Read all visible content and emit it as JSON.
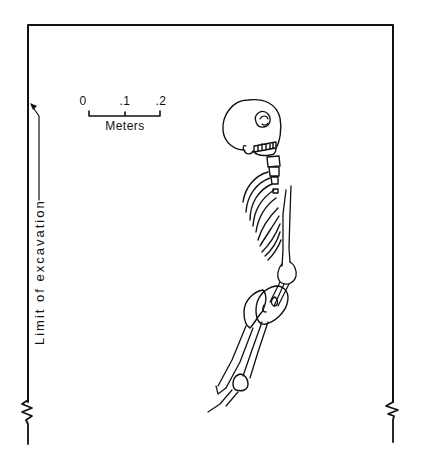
{
  "figure": {
    "type": "burial-excavation-plan"
  },
  "scale_bar": {
    "ticks": [
      "0",
      ".1",
      ".2"
    ],
    "unit_label": "Meters"
  },
  "annotations": {
    "excavation_limit_label": "Limit of excavation"
  },
  "colors": {
    "ink": "#111111",
    "background": "#ffffff"
  }
}
